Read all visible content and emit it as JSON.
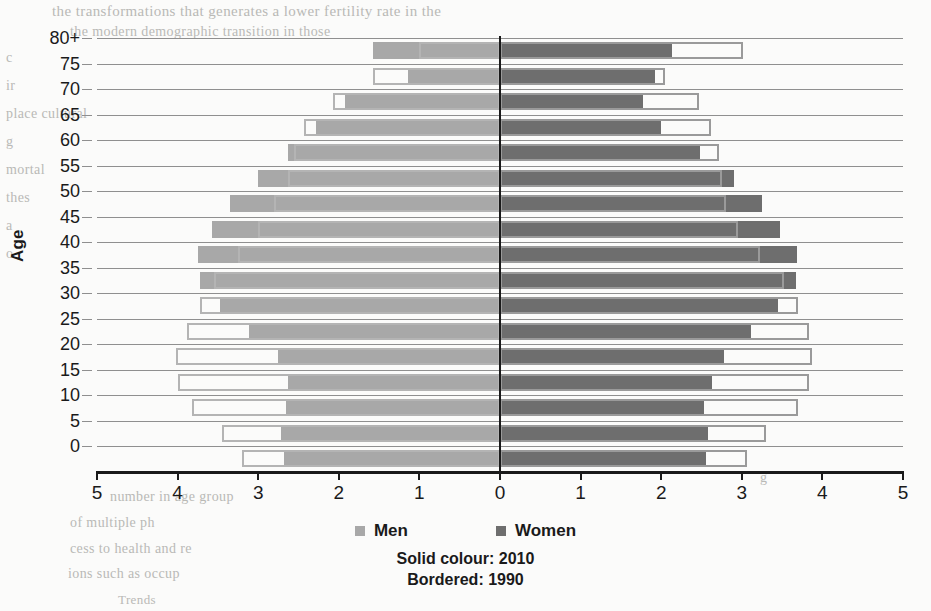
{
  "chart_data": {
    "type": "bar",
    "subtype": "population-pyramid",
    "title": "",
    "xlabel": "",
    "ylabel": "Age",
    "xlim": [
      -5,
      5
    ],
    "xticks": [
      5,
      4,
      3,
      2,
      1,
      0,
      1,
      2,
      3,
      4,
      5
    ],
    "grid": true,
    "legend_position": "bottom",
    "categories": [
      "80+",
      "75",
      "70",
      "65",
      "60",
      "55",
      "50",
      "45",
      "40",
      "35",
      "30",
      "25",
      "20",
      "15",
      "10",
      "5",
      "0"
    ],
    "series": [
      {
        "name": "Men",
        "year": "2010",
        "style": "solid",
        "color": "#a8a8a8",
        "values": [
          1.57,
          1.14,
          1.92,
          2.28,
          2.63,
          3.0,
          3.35,
          3.57,
          3.75,
          3.72,
          3.48,
          3.12,
          2.75,
          2.63,
          2.65,
          2.72,
          2.68
        ]
      },
      {
        "name": "Men",
        "year": "1990",
        "style": "bordered",
        "color": "#b4b4b4",
        "values": [
          1.0,
          1.57,
          2.07,
          2.43,
          2.55,
          2.63,
          2.8,
          3.0,
          3.25,
          3.55,
          3.72,
          3.88,
          4.02,
          4.0,
          3.82,
          3.45,
          3.2
        ]
      },
      {
        "name": "Women",
        "year": "2010",
        "style": "solid",
        "color": "#6e6e6e",
        "values": [
          2.13,
          1.92,
          1.78,
          2.0,
          2.48,
          2.9,
          3.25,
          3.47,
          3.68,
          3.67,
          3.45,
          3.12,
          2.78,
          2.63,
          2.53,
          2.58,
          2.55
        ]
      },
      {
        "name": "Women",
        "year": "1990",
        "style": "bordered",
        "color": "#9a9a9a",
        "values": [
          3.02,
          2.05,
          2.47,
          2.62,
          2.72,
          2.75,
          2.8,
          2.95,
          3.22,
          3.52,
          3.7,
          3.83,
          3.87,
          3.83,
          3.7,
          3.3,
          3.07
        ]
      }
    ],
    "annotations": [
      "Solid colour: 2010",
      "Bordered: 1990"
    ]
  },
  "axes": {
    "y_label": "Age",
    "y_ticks": [
      "80+",
      "75",
      "70",
      "65",
      "60",
      "55",
      "50",
      "45",
      "40",
      "35",
      "30",
      "25",
      "20",
      "15",
      "10",
      "5",
      "0"
    ],
    "x_ticks": [
      "5",
      "4",
      "3",
      "2",
      "1",
      "0",
      "1",
      "2",
      "3",
      "4",
      "5"
    ]
  },
  "legend": {
    "items": [
      {
        "label": "Men",
        "color": "#a8a8a8"
      },
      {
        "label": "Women",
        "color": "#6e6e6e"
      }
    ]
  },
  "captions": {
    "solid": "Solid colour: 2010",
    "bordered": "Bordered: 1990"
  },
  "background_text": {
    "t1": "the transformations that generates a lower fertility rate in the",
    "t2": "the modern demographic transition in those",
    "t3": "c",
    "t4": "ir",
    "t5": "place cultural",
    "t6": "g",
    "t7": "mortal",
    "t8": "thes",
    "t9": "a",
    "t10": "o",
    "b1": "number  in age group",
    "b2": "of multiple ph",
    "b3": "cess to health and re",
    "b4": "ions such as occup",
    "b5": "Trends",
    "r1": "g"
  }
}
